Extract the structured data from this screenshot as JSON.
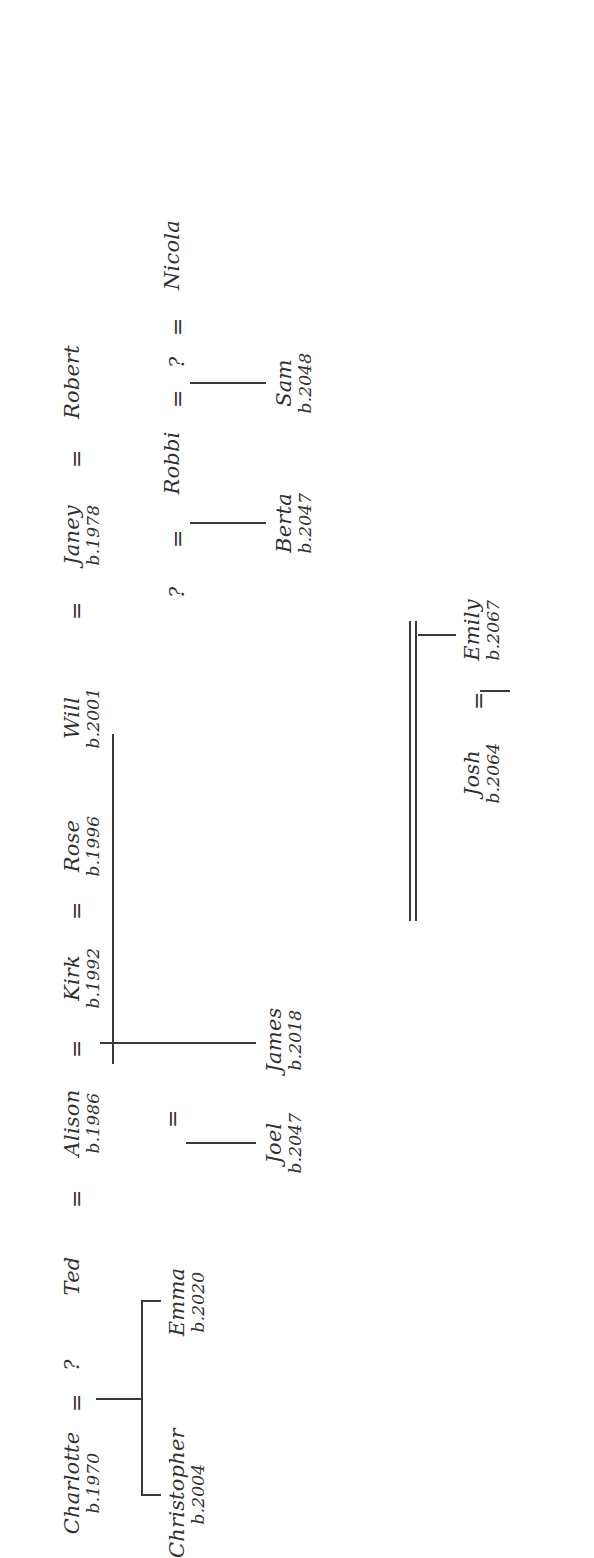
{
  "document": {
    "kind": "hand-lettered family tree diagram",
    "orientation": "rotated 90 degrees counter-clockwise on the page",
    "background_color": "#ffffff",
    "ink_color": "#2f2f2f",
    "union_symbol": "=",
    "unknown_symbol": "?"
  },
  "persons": {
    "charlotte": {
      "name": "Charlotte",
      "birth": "b.1970"
    },
    "unknown_1": {
      "name": "?",
      "birth": ""
    },
    "ted": {
      "name": "Ted",
      "birth": ""
    },
    "alison": {
      "name": "Alison",
      "birth": "b.1986"
    },
    "kirk": {
      "name": "Kirk",
      "birth": "b.1992"
    },
    "rose": {
      "name": "Rose",
      "birth": "b.1996"
    },
    "will": {
      "name": "Will",
      "birth": "b.2001"
    },
    "janey": {
      "name": "Janey",
      "birth": "b.1978"
    },
    "robert": {
      "name": "Robert",
      "birth": ""
    },
    "unknown_2": {
      "name": "?",
      "birth": ""
    },
    "robbi": {
      "name": "Robbi",
      "birth": ""
    },
    "unknown_3": {
      "name": "?",
      "birth": ""
    },
    "nicola": {
      "name": "Nicola",
      "birth": ""
    },
    "christopher": {
      "name": "Christopher",
      "birth": "b.2004"
    },
    "emma": {
      "name": "Emma",
      "birth": "b.2020"
    },
    "joel": {
      "name": "Joel",
      "birth": "b.2047"
    },
    "james": {
      "name": "James",
      "birth": "b.2018"
    },
    "berta": {
      "name": "Berta",
      "birth": "b.2047"
    },
    "sam": {
      "name": "Sam",
      "birth": "b.2048"
    },
    "josh": {
      "name": "Josh",
      "birth": "b.2064"
    },
    "emily": {
      "name": "Emily",
      "birth": "b.2067"
    }
  },
  "unions": [
    {
      "left": "charlotte",
      "right": "unknown_1",
      "symbol": "="
    },
    {
      "left": "ted",
      "right": "alison",
      "symbol": "="
    },
    {
      "left": "alison",
      "right": "kirk",
      "symbol": "="
    },
    {
      "left": "kirk",
      "right": "rose",
      "symbol": "="
    },
    {
      "left": "janey",
      "right": "robert",
      "symbol": "="
    },
    {
      "left": "unknown_2",
      "right": "robbi",
      "symbol": "="
    },
    {
      "left": "robbi",
      "right": "unknown_3",
      "symbol": "="
    },
    {
      "left": "unknown_3",
      "right": "nicola",
      "symbol": "="
    },
    {
      "left": "josh",
      "right": "emily",
      "symbol": "="
    },
    {
      "left": "alison",
      "right": "joel",
      "symbol": "="
    }
  ],
  "descent_links": [
    {
      "from": "charlotte-union",
      "to": [
        "christopher",
        "emma"
      ]
    },
    {
      "from": "alison-union",
      "to": [
        "joel",
        "james"
      ]
    },
    {
      "from": "robbi-union-left",
      "to": [
        "berta"
      ]
    },
    {
      "from": "robbi-union-right",
      "to": [
        "sam"
      ]
    },
    {
      "from": "lower-couple",
      "to": [
        "emily"
      ]
    }
  ]
}
